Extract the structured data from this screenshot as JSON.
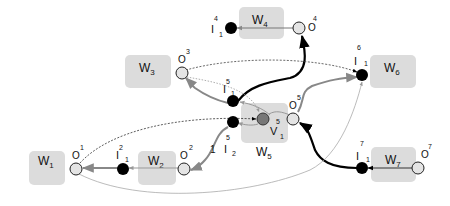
{
  "diagram": {
    "type": "workflow-graph",
    "colors": {
      "box": "#dcdcdc",
      "input_node": "#000000",
      "output_node": "#e4e4e4",
      "variable_node": "#777777",
      "edge_strong": "#000000",
      "edge_medium": "#888888",
      "edge_light": "#aaaaaa"
    },
    "workers": [
      {
        "id": "W1",
        "name": "W",
        "sub": "1"
      },
      {
        "id": "W2",
        "name": "W",
        "sub": "2"
      },
      {
        "id": "W3",
        "name": "W",
        "sub": "3"
      },
      {
        "id": "W4",
        "name": "W",
        "sub": "4"
      },
      {
        "id": "W5",
        "name": "W",
        "sub": "5"
      },
      {
        "id": "W6",
        "name": "W",
        "sub": "6"
      },
      {
        "id": "W7",
        "name": "W",
        "sub": "7"
      }
    ],
    "nodes": {
      "O1": {
        "letter": "O",
        "sup": "1",
        "sub": "",
        "kind": "output"
      },
      "O2": {
        "letter": "O",
        "sup": "2",
        "sub": "",
        "kind": "output"
      },
      "O3": {
        "letter": "O",
        "sup": "3",
        "sub": "",
        "kind": "output"
      },
      "O4": {
        "letter": "O",
        "sup": "4",
        "sub": "",
        "kind": "output"
      },
      "O5": {
        "letter": "O",
        "sup": "5",
        "sub": "",
        "kind": "output"
      },
      "O7": {
        "letter": "O",
        "sup": "7",
        "sub": "",
        "kind": "output"
      },
      "I2_1": {
        "letter": "I",
        "sup": "2",
        "sub": "1",
        "kind": "input"
      },
      "I4_1": {
        "letter": "I",
        "sup": "4",
        "sub": "1",
        "kind": "input"
      },
      "I5_1": {
        "letter": "I",
        "sup": "5",
        "sub": "1",
        "kind": "input"
      },
      "I5_2": {
        "letter": "I",
        "sup": "5",
        "sub": "2",
        "kind": "input"
      },
      "I6_1": {
        "letter": "I",
        "sup": "6",
        "sub": "1",
        "kind": "input"
      },
      "I7_1": {
        "letter": "I",
        "sup": "7",
        "sub": "1",
        "kind": "input"
      },
      "V5_1": {
        "letter": "V",
        "sup": "5",
        "sub": "1",
        "kind": "variable"
      }
    },
    "edge_labels": {
      "O2_to_I5_2": "1"
    },
    "edges": [
      {
        "from": "O4",
        "to": "I4_1",
        "style": "medium"
      },
      {
        "from": "I5_1",
        "to": "O4",
        "style": "strong"
      },
      {
        "from": "I5_1",
        "to": "O3",
        "style": "medium"
      },
      {
        "from": "O3",
        "to": "I6_1",
        "style": "light-dashed"
      },
      {
        "from": "O3",
        "to": "V5_1",
        "style": "light-dotted"
      },
      {
        "from": "V5_1",
        "to": "I5_1",
        "style": "light"
      },
      {
        "from": "V5_1",
        "to": "I5_2",
        "style": "light"
      },
      {
        "from": "O5",
        "to": "I6_1",
        "style": "medium"
      },
      {
        "from": "O5",
        "to": "V5_1",
        "style": "light"
      },
      {
        "from": "I7_1",
        "to": "O5",
        "style": "strong"
      },
      {
        "from": "O7",
        "to": "I7_1",
        "style": "medium"
      },
      {
        "from": "I5_2",
        "to": "O2",
        "style": "medium"
      },
      {
        "from": "O2",
        "to": "I2_1",
        "style": "light"
      },
      {
        "from": "I2_1",
        "to": "O1",
        "style": "medium"
      },
      {
        "from": "O1",
        "to": "V5_1",
        "style": "light-dashed"
      },
      {
        "from": "O1",
        "to": "I6_1",
        "style": "light"
      }
    ]
  }
}
